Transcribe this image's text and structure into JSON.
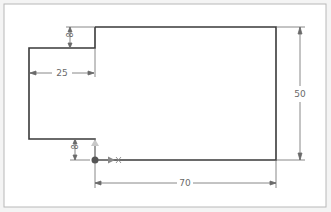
{
  "colors": {
    "background": "#f4f4f4",
    "sheet": "#ffffff",
    "frame": "#b8b8b8",
    "geometry": "#3a3a3a",
    "dimension": "#6a6a6a",
    "origin_dot": "#555555",
    "axis_y": "#c8c8c8",
    "axis_x": "#888888"
  },
  "dimensions": {
    "top_step_height": "8",
    "step_width": "25",
    "total_height": "50",
    "bottom_step_height": "8",
    "total_width": "70"
  }
}
